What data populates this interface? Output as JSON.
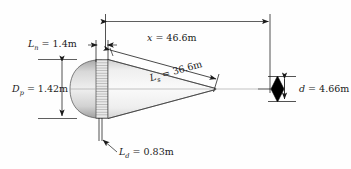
{
  "figure": {
    "type": "engineering-dimension-drawing",
    "background_color": "#fefefe",
    "line_color": "#1a1a1a",
    "body_fill_light": "#f4f4f4",
    "body_fill_dark": "#b9b9b9",
    "marker_fill": "#000000"
  },
  "dimensions": [
    {
      "id": "x",
      "symbol": "x",
      "subscript": "",
      "equals": "=",
      "value": "46.6",
      "unit": "m",
      "text": "x = 46.6m",
      "orientation": "horizontal",
      "placement": "top"
    },
    {
      "id": "Ln",
      "symbol": "L",
      "subscript": "n",
      "equals": "=",
      "value": "1.4",
      "unit": "m",
      "text": "L_n = 1.4m",
      "orientation": "horizontal",
      "placement": "upper-left"
    },
    {
      "id": "Ls",
      "symbol": "L",
      "subscript": "s",
      "equals": "=",
      "value": "36.6",
      "unit": "m",
      "text": "L_s = 36.6m",
      "orientation": "diagonal",
      "placement": "along-cone-slant"
    },
    {
      "id": "Dp",
      "symbol": "D",
      "subscript": "p",
      "equals": "=",
      "value": "1.42",
      "unit": "m",
      "text": "D_p = 1.42m",
      "orientation": "vertical",
      "placement": "left"
    },
    {
      "id": "Ld",
      "symbol": "L",
      "subscript": "d",
      "equals": "=",
      "value": "0.83",
      "unit": "m",
      "text": "L_d = 0.83m",
      "orientation": "leader",
      "placement": "bottom"
    },
    {
      "id": "d",
      "symbol": "d",
      "subscript": "",
      "equals": "=",
      "value": "4.66",
      "unit": "m",
      "text": "d = 4.66m",
      "orientation": "vertical",
      "placement": "right"
    }
  ],
  "labels": {
    "x": {
      "sym": "x",
      "sub": "",
      "rest": " = 46.6m"
    },
    "Ln": {
      "sym": "L",
      "sub": "n",
      "rest": " = 1.4m"
    },
    "Ls": {
      "sym": "L",
      "sub": "s",
      "rest": " = 36.6m"
    },
    "Dp": {
      "sym": "D",
      "sub": "p",
      "rest": " = 1.42m"
    },
    "Ld": {
      "sym": "L",
      "sub": "d",
      "rest": " = 0.83m"
    },
    "d": {
      "sym": "d",
      "sub": "",
      "rest": " = 4.66m"
    }
  }
}
